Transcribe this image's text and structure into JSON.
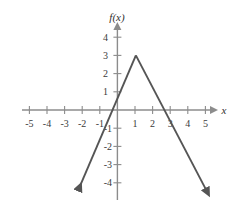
{
  "figure": {
    "name": "function-graph",
    "background_color": "#ffffff",
    "axis_color": "#8c8c8c",
    "curve_color": "#555555",
    "label_color": "#3a3a3a"
  },
  "axes": {
    "x_axis_label": "x",
    "y_axis_label": "f(x)",
    "x_ticks": [
      {
        "value": -5,
        "label": "-5"
      },
      {
        "value": -4,
        "label": "-4"
      },
      {
        "value": -3,
        "label": "-3"
      },
      {
        "value": -2,
        "label": "-2"
      },
      {
        "value": -1,
        "label": "-1"
      },
      {
        "value": 1,
        "label": "1"
      },
      {
        "value": 2,
        "label": "2"
      },
      {
        "value": 3,
        "label": "3"
      },
      {
        "value": 4,
        "label": "4"
      },
      {
        "value": 5,
        "label": "5"
      }
    ],
    "y_ticks": [
      {
        "value": 4,
        "label": "4"
      },
      {
        "value": 3,
        "label": "3"
      },
      {
        "value": 2,
        "label": "2"
      },
      {
        "value": 1,
        "label": "1"
      },
      {
        "value": -1,
        "label": "-1"
      },
      {
        "value": -2,
        "label": "-2"
      },
      {
        "value": -3,
        "label": "-3"
      },
      {
        "value": -4,
        "label": "-4"
      }
    ]
  },
  "chart_data": {
    "type": "line",
    "title": "",
    "xlabel": "x",
    "ylabel": "f(x)",
    "xlim": [
      -5.6,
      5.6
    ],
    "ylim": [
      -4.6,
      4.6
    ],
    "grid": false,
    "legend": "none",
    "series": [
      {
        "name": "f(x)",
        "shape": "inverted-v",
        "points": [
          {
            "x": -2.2,
            "y": -4.35
          },
          {
            "x": 1.05,
            "y": 3.0
          },
          {
            "x": 5.05,
            "y": -4.4
          }
        ],
        "vertex": {
          "x": 1.05,
          "y": 3.0
        },
        "y_intercept": 0.7,
        "x_intercepts": [
          -0.35,
          2.85
        ],
        "left_slope": 2.26,
        "right_slope": -1.85,
        "arrow_start": true,
        "arrow_end": true
      }
    ]
  }
}
